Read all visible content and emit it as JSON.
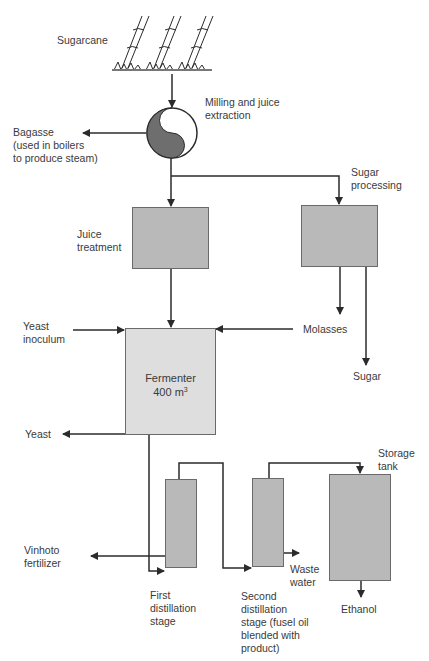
{
  "diagram": {
    "nodes": {
      "sugarcane": {
        "label": "Sugarcane"
      },
      "milling": {
        "label": "Milling and juice\nextraction"
      },
      "bagasse": {
        "label": "Bagasse\n(used in boilers\nto produce steam)"
      },
      "sugar_processing": {
        "label": "Sugar\nprocessing"
      },
      "juice_treatment": {
        "label": "Juice\ntreatment"
      },
      "yeast_inoculum": {
        "label": "Yeast\ninoculum"
      },
      "molasses": {
        "label": "Molasses"
      },
      "sugar": {
        "label": "Sugar"
      },
      "fermenter": {
        "label": "Fermenter",
        "capacity_value": "400 m",
        "capacity_exponent": "3"
      },
      "yeast": {
        "label": "Yeast"
      },
      "vinhoto": {
        "label": "Vinhoto\nfertilizer"
      },
      "first_distillation": {
        "label": "First\ndistillation\nstage"
      },
      "second_distillation": {
        "label": "Second\ndistillation\nstage (fusel oil\nblended with\nproduct)"
      },
      "waste_water": {
        "label": "Waste\nwater"
      },
      "storage_tank": {
        "label": "Storage\ntank"
      },
      "ethanol": {
        "label": "Ethanol"
      }
    },
    "edges": [
      {
        "from": "sugarcane",
        "to": "milling"
      },
      {
        "from": "milling",
        "to": "bagasse"
      },
      {
        "from": "milling",
        "to": "juice_treatment"
      },
      {
        "from": "milling",
        "to": "sugar_processing"
      },
      {
        "from": "sugar_processing",
        "to": "molasses"
      },
      {
        "from": "sugar_processing",
        "to": "sugar"
      },
      {
        "from": "juice_treatment",
        "to": "fermenter"
      },
      {
        "from": "yeast_inoculum",
        "to": "fermenter"
      },
      {
        "from": "molasses",
        "to": "fermenter"
      },
      {
        "from": "fermenter",
        "to": "yeast"
      },
      {
        "from": "fermenter",
        "to": "first_distillation"
      },
      {
        "from": "first_distillation",
        "to": "vinhoto"
      },
      {
        "from": "first_distillation",
        "to": "second_distillation"
      },
      {
        "from": "second_distillation",
        "to": "waste_water"
      },
      {
        "from": "second_distillation",
        "to": "storage_tank"
      },
      {
        "from": "storage_tank",
        "to": "ethanol"
      }
    ],
    "colors": {
      "line": "#2b2b2b",
      "box_dark": "#b9b9b9",
      "box_light": "#dedede",
      "mill_fill": "#6e6e6e",
      "text": "#3a3a3a"
    }
  }
}
